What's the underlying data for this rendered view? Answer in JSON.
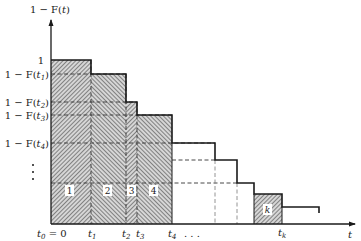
{
  "diagram": {
    "y_axis": {
      "label_prefix": "1 − F(",
      "label_var": "t",
      "label_suffix": ")",
      "ticks": [
        {
          "text": "1",
          "y": 60
        },
        {
          "prefix": "1 − F(",
          "var": "t",
          "sub": "1",
          "suffix": ")",
          "y": 74
        },
        {
          "prefix": "1 − F(",
          "var": "t",
          "sub": "2",
          "suffix": ")",
          "y": 102
        },
        {
          "prefix": "1 − F(",
          "var": "t",
          "sub": "3",
          "suffix": ")",
          "y": 115
        },
        {
          "prefix": "1 − F(",
          "var": "t",
          "sub": "4",
          "suffix": ")",
          "y": 143
        }
      ],
      "ellipsis": "⋮"
    },
    "x_axis": {
      "label": "t",
      "ticks": [
        {
          "var": "t",
          "sub": "0",
          "suffix": " = 0",
          "x": 51
        },
        {
          "var": "t",
          "sub": "1",
          "x": 91
        },
        {
          "var": "t",
          "sub": "2",
          "x": 126
        },
        {
          "var": "t",
          "sub": "3",
          "x": 137
        },
        {
          "var": "t",
          "sub": "4",
          "x": 172
        },
        {
          "var": "t",
          "sub": "k",
          "x": 282
        }
      ],
      "ellipsis": ". . ."
    },
    "regions": [
      {
        "label": "1",
        "x0": 51,
        "x1": 91,
        "top": 60
      },
      {
        "label": "2",
        "x0": 91,
        "x1": 126,
        "top": 74
      },
      {
        "label": "3",
        "x0": 126,
        "x1": 137,
        "top": 102
      },
      {
        "label": "4",
        "x0": 137,
        "x1": 172,
        "top": 115
      },
      {
        "label": "k",
        "x0": 254,
        "x1": 282,
        "top": 194
      }
    ],
    "colors": {
      "line": "#1a1a1a",
      "hatch": "#3a3a3a",
      "dashed": "#555555",
      "background": "#ffffff"
    }
  }
}
